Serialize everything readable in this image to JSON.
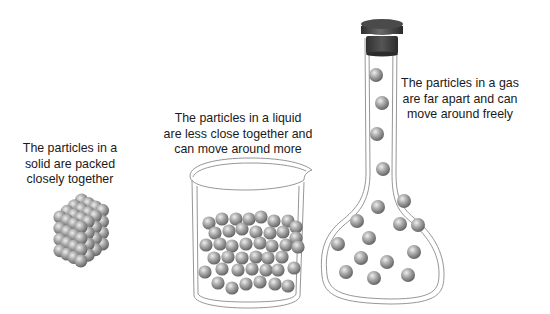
{
  "diagram": {
    "title": "",
    "states": [
      {
        "id": "solid",
        "caption_lines": [
          "The particles in a",
          "solid are packed",
          "closely together"
        ],
        "container": "none",
        "arrangement": "regular lattice cube"
      },
      {
        "id": "liquid",
        "caption_lines": [
          "The particles in a liquid",
          "are less close together and",
          "can move around more"
        ],
        "container": "beaker",
        "arrangement": "random close-packed"
      },
      {
        "id": "gas",
        "caption_lines": [
          "The particles in a gas",
          "are far apart and can",
          "move around freely"
        ],
        "container": "stoppered flask",
        "arrangement": "widely spaced"
      }
    ],
    "colors": {
      "particle": "#9a9a9a",
      "particle_highlight": "#e6e6e6",
      "particle_shadow": "#5c5c5c",
      "glass_outline": "#8a8a8a",
      "stopper": "#3f3f3f",
      "text": "#1a1a1a"
    }
  }
}
